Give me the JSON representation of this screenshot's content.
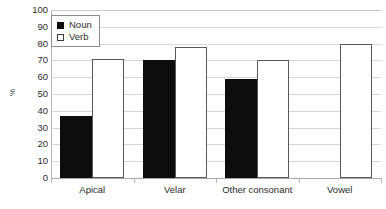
{
  "chart_data": {
    "type": "bar",
    "title": "",
    "xlabel": "",
    "ylabel": "%",
    "ylim": [
      0,
      100
    ],
    "ytick_step": 10,
    "yticks": [
      100,
      90,
      80,
      70,
      60,
      50,
      40,
      30,
      20,
      10,
      0
    ],
    "grid": true,
    "legend_position": "top-left",
    "categories": [
      "Apical",
      "Velar",
      "Other consonant",
      "Vowel"
    ],
    "series": [
      {
        "name": "Noun",
        "color": "#0d0d0d",
        "values": [
          37,
          70,
          59,
          null
        ]
      },
      {
        "name": "Verb",
        "color": "#ffffff",
        "values": [
          71,
          78,
          70,
          80
        ]
      }
    ]
  },
  "legend": {
    "items": [
      {
        "label": "Noun",
        "swatch": "filled-square-icon"
      },
      {
        "label": "Verb",
        "swatch": "open-square-icon"
      }
    ]
  },
  "axes": {
    "y_title": "%"
  }
}
